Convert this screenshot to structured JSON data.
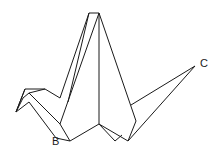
{
  "figure": {
    "stroke_color": "#1a1a1a",
    "background": "#ffffff",
    "labels": [
      {
        "id": "B",
        "text": "B",
        "x": 52,
        "y": 142
      },
      {
        "id": "C",
        "text": "C",
        "x": 200,
        "y": 58
      }
    ]
  }
}
